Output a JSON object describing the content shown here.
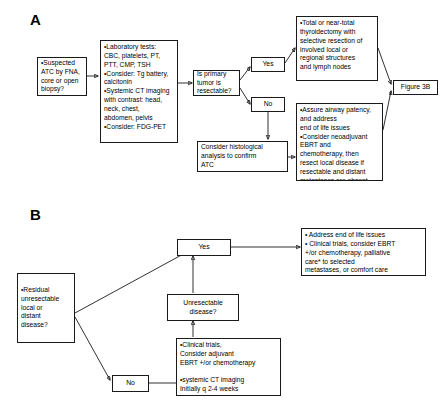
{
  "figure": {
    "panels": [
      {
        "id": "A",
        "label": "A",
        "nodes": {
          "suspected": "•Suspected\nATC by FNA,\ncore or open\nbiopsy?",
          "workup": "•Laboratory tests:\n CBC, platelets, PT,\n PTT, CMP, TSH\n•Consider: Tg battery,\n calcitonin\n•Systemic CT imaging\n with contrast: head,\n neck, chest,\n abdomen, pelvis\n•Consider: FDG-PET",
          "decision_resectable": "Is primary tumor is\nresectable?",
          "yes": "Yes",
          "no": "No",
          "surgery": "•Total or near-total\n thyroidectomy with\n selective resection of\n involved local or\n regional structures\n and lymph nodes",
          "palliative_neoadjuvant": "•Assure airway patency,\n and address\n end of life issues\n•Consider neoadjuvant\n EBRT and\n chemotherapy, then\n resect local disease if\n resectable and distant\n metastases are absent",
          "histology": "Consider histological\nanalysis to confirm\nATC",
          "figure_ref": "Figure 3B"
        }
      },
      {
        "id": "B",
        "label": "B",
        "nodes": {
          "residual": "•Residual\n unresectable\n local or\n distant\n disease?",
          "yes": "Yes",
          "no": "No",
          "end_of_life": "• Address end of life issues\n• Clinical trials, consider EBRT\n  +/or chemotherapy, palliative\n  care* to selected\n  metastases, or comfort care",
          "unresectable_decision": "Unresectable\ndisease?",
          "adjuvant": "•Clinical trials,\n Consider adjuvant\n EBRT +/or chemotherapy\n\n•systemic CT imaging\n Initially q 2-4 weeks"
        }
      }
    ]
  },
  "style": {
    "line_color": "#1a1a1a",
    "box_fill": "#ffffff",
    "text_color": "#000000",
    "page_background": "#ffffff"
  }
}
